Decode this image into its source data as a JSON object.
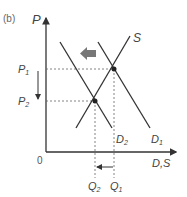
{
  "panel_label": "(b)",
  "axes": {
    "y_label": "P",
    "x_label": "D,S",
    "origin_label": "0"
  },
  "prices": {
    "p1": {
      "base": "P",
      "sub": "1"
    },
    "p2": {
      "base": "P",
      "sub": "2"
    }
  },
  "quantities": {
    "q1": {
      "base": "Q",
      "sub": "1"
    },
    "q2": {
      "base": "Q",
      "sub": "2"
    }
  },
  "curves": {
    "supply": {
      "base": "S",
      "sub": ""
    },
    "demand1": {
      "base": "D",
      "sub": "1"
    },
    "demand2": {
      "base": "D",
      "sub": "2"
    }
  },
  "colors": {
    "line": "#333333",
    "dashed": "#666666",
    "shift_arrow": "#777777"
  }
}
